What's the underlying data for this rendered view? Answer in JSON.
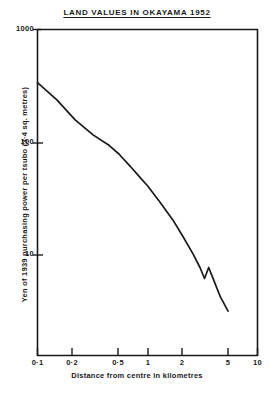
{
  "chart_data": {
    "type": "line",
    "title": "LAND VALUES IN OKAYAMA 1952",
    "xlabel": "Distance from centre in kilometres",
    "ylabel": "Yen of 1939 purchasing power per tsubo (3·4 sq. metres)",
    "xscale": "log",
    "yscale": "log",
    "xlim": [
      0.1,
      10
    ],
    "ylim": [
      2,
      1000
    ],
    "grid": false,
    "legend": null,
    "x_ticks": [
      {
        "value": 0.1,
        "label": "0·1"
      },
      {
        "value": 0.2,
        "label": "0·2"
      },
      {
        "value": 0.5,
        "label": "0·5"
      },
      {
        "value": 1,
        "label": "1"
      },
      {
        "value": 2,
        "label": "2"
      },
      {
        "value": 5,
        "label": "5"
      },
      {
        "value": 10,
        "label": "10"
      }
    ],
    "y_ticks": [
      {
        "value": 1000,
        "label": "1000"
      },
      {
        "value": 100,
        "label": "100"
      },
      {
        "value": 10,
        "label": "10"
      }
    ],
    "series": [
      {
        "name": "Land value",
        "x": [
          0.1,
          0.15,
          0.22,
          0.32,
          0.45,
          0.55,
          0.7,
          0.85,
          1.0,
          1.3,
          1.7,
          2.1,
          2.6,
          3.0,
          3.3,
          3.6,
          4.0,
          4.6,
          5.4
        ],
        "y": [
          340,
          240,
          160,
          118,
          95,
          80,
          62,
          50,
          42,
          30,
          21,
          15,
          10.5,
          8.0,
          6.4,
          8.0,
          6.2,
          4.4,
          3.3
        ]
      }
    ]
  }
}
